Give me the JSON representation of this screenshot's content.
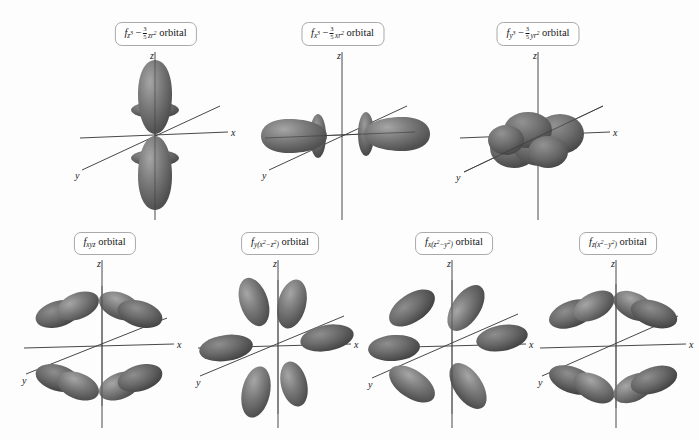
{
  "figure": {
    "background_color": "#fdfdfd",
    "axis_color": "#333333",
    "lobe_color": "#6e6e6e",
    "lobe_highlight_color": "#9a9a9a",
    "lobe_shadow_color": "#4a4a4a",
    "label_border_color": "#a9a9a9"
  },
  "axis_labels": {
    "x": "x",
    "y": "y",
    "z": "z"
  },
  "common": {
    "orbital_word": "orbital"
  },
  "orbitals": [
    {
      "id": "fz3",
      "row": 1,
      "column": 1,
      "label_plain": "fz3 − 3/5 zr2 orbital",
      "base": "f",
      "subscript": "z",
      "subscript_exponent": "3",
      "minus": "−",
      "fraction_numerator": "3",
      "fraction_denominator": "5",
      "term_var": "zr",
      "term_exponent": "2",
      "suffix": "orbital",
      "shape": "two-vertical-lobes-with-two-tori",
      "lobe_count": 2,
      "torus_count": 2
    },
    {
      "id": "fx3",
      "row": 1,
      "column": 2,
      "label_plain": "fx3 − 3/5 xr2 orbital",
      "base": "f",
      "subscript": "x",
      "subscript_exponent": "3",
      "minus": "−",
      "fraction_numerator": "3",
      "fraction_denominator": "5",
      "term_var": "xr",
      "term_exponent": "2",
      "suffix": "orbital",
      "shape": "two-horizontal-lobes-with-two-tori",
      "lobe_count": 2,
      "torus_count": 2
    },
    {
      "id": "fy3",
      "row": 1,
      "column": 3,
      "label_plain": "fy3 − 3/5 yr2 orbital",
      "base": "f",
      "subscript": "y",
      "subscript_exponent": "3",
      "minus": "−",
      "fraction_numerator": "3",
      "fraction_denominator": "5",
      "term_var": "yr",
      "term_exponent": "2",
      "suffix": "orbital",
      "shape": "end-on-cloud-along-y",
      "lobe_count": 2,
      "torus_count": 2
    },
    {
      "id": "fxyz",
      "row": 2,
      "column": 1,
      "label_plain": "fxyz orbital",
      "base": "f",
      "subscript": "xyz",
      "suffix": "orbital",
      "shape": "eight-lobe-cubic",
      "lobe_count": 8,
      "torus_count": 0
    },
    {
      "id": "fy_x2_minus_z2",
      "row": 2,
      "column": 2,
      "label_plain": "fy(x2 − z2) orbital",
      "base": "f",
      "subscript": "y",
      "paren_open": "(",
      "paren_var1": "x",
      "paren_exp1": "2",
      "paren_minus": "−",
      "paren_var2": "z",
      "paren_exp2": "2",
      "paren_close": ")",
      "suffix": "orbital",
      "shape": "six-lobe-rosette",
      "lobe_count": 6,
      "torus_count": 0
    },
    {
      "id": "fx_z2_minus_y2",
      "row": 2,
      "column": 3,
      "label_plain": "fx(z2 − y2) orbital",
      "base": "f",
      "subscript": "x",
      "paren_open": "(",
      "paren_var1": "z",
      "paren_exp1": "2",
      "paren_minus": "−",
      "paren_var2": "y",
      "paren_exp2": "2",
      "paren_close": ")",
      "suffix": "orbital",
      "shape": "six-lobe-rosette",
      "lobe_count": 6,
      "torus_count": 0
    },
    {
      "id": "fz_x2_minus_y2",
      "row": 2,
      "column": 4,
      "label_plain": "fz(x2 − y2) orbital",
      "base": "f",
      "subscript": "z",
      "paren_open": "(",
      "paren_var1": "x",
      "paren_exp1": "2",
      "paren_minus": "−",
      "paren_var2": "y",
      "paren_exp2": "2",
      "paren_close": ")",
      "suffix": "orbital",
      "shape": "eight-lobe-cubic",
      "lobe_count": 8,
      "torus_count": 0
    }
  ]
}
